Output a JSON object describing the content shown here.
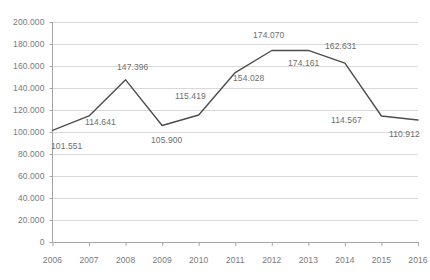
{
  "chart_data": {
    "type": "line",
    "title": "",
    "subtitle": "",
    "xlabel": "",
    "ylabel": "",
    "categories": [
      "2006",
      "2007",
      "2008",
      "2009",
      "2010",
      "2011",
      "2012",
      "2013",
      "2014",
      "2015",
      "2016"
    ],
    "values": [
      101.551,
      114.641,
      147.396,
      105.9,
      115.419,
      154.028,
      174.07,
      174.161,
      162.631,
      114.567,
      110.912
    ],
    "point_labels": [
      "101.551",
      "114.641",
      "147.396",
      "105.900",
      "115.419",
      "154.028",
      "174.070",
      "174.161",
      "162.631",
      "114.567",
      "110.912"
    ],
    "series": [
      {
        "name": "",
        "values": [
          101.551,
          114.641,
          147.396,
          105.9,
          115.419,
          154.028,
          174.07,
          174.161,
          162.631,
          114.567,
          110.912
        ],
        "color": "#4d4d4d"
      }
    ],
    "ylim": [
      0,
      200
    ],
    "ytick_values": [
      0,
      20,
      40,
      60,
      80,
      100,
      120,
      140,
      160,
      180,
      200
    ],
    "ytick_labels": [
      "0",
      "20.000",
      "40.000",
      "60.000",
      "80.000",
      "100.000",
      "120.000",
      "140.000",
      "160.000",
      "180.000",
      "200.000"
    ],
    "grid": true,
    "grid_color": "#d9d9d9",
    "axis_color": "#a6a6a6",
    "legend": "none",
    "legend_position": "none",
    "background_color": "#ffffff",
    "label_color": "#6e6e6e"
  },
  "axis": {
    "y_labels": [
      {
        "text": "200.000",
        "top": 17
      },
      {
        "text": "180.000",
        "top": 39
      },
      {
        "text": "160.000",
        "top": 61
      },
      {
        "text": "140.000",
        "top": 83
      },
      {
        "text": "120.000",
        "top": 105
      },
      {
        "text": "100.000",
        "top": 127
      },
      {
        "text": "80.000",
        "top": 149
      },
      {
        "text": "60.000",
        "top": 171
      },
      {
        "text": "40.000",
        "top": 193
      },
      {
        "text": "20.000",
        "top": 215
      },
      {
        "text": "0",
        "top": 237
      }
    ],
    "x_labels": [
      {
        "text": "2006",
        "left": 54
      },
      {
        "text": "2007",
        "left": 87
      },
      {
        "text": "2008",
        "left": 120
      },
      {
        "text": "2009",
        "left": 153
      },
      {
        "text": "2010",
        "left": 186
      },
      {
        "text": "2011",
        "left": 219
      },
      {
        "text": "2012",
        "left": 252
      },
      {
        "text": "2013",
        "left": 285
      },
      {
        "text": "2014",
        "left": 318
      },
      {
        "text": "2015",
        "left": 351
      },
      {
        "text": "2016",
        "left": 384
      }
    ]
  },
  "data_labels": [
    {
      "text": "101.551",
      "left": 51,
      "top": 141
    },
    {
      "text": "114.641",
      "left": 85,
      "top": 117
    },
    {
      "text": "147.396",
      "left": 117,
      "top": 62
    },
    {
      "text": "105.900",
      "left": 151,
      "top": 135
    },
    {
      "text": "115.419",
      "left": 175,
      "top": 91
    },
    {
      "text": "154.028",
      "left": 233,
      "top": 73
    },
    {
      "text": "174.070",
      "left": 253,
      "top": 30
    },
    {
      "text": "174.161",
      "left": 288,
      "top": 58
    },
    {
      "text": "162.631",
      "left": 325,
      "top": 41
    },
    {
      "text": "114.567",
      "left": 331,
      "top": 115
    },
    {
      "text": "110.912",
      "left": 389,
      "top": 129
    }
  ]
}
